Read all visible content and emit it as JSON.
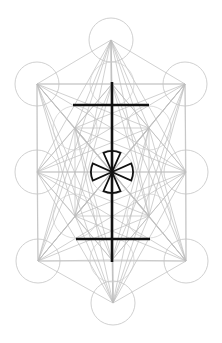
{
  "diagram": {
    "colors": {
      "background": "#ffffff",
      "guide_lines": "#bdbdbd",
      "circles": "#c4c4c4",
      "bold_symbol": "#111111"
    },
    "outer_vertices": [
      {
        "name": "top",
        "x": 111,
        "y": 40
      },
      {
        "name": "upper-left",
        "x": 37,
        "y": 84
      },
      {
        "name": "upper-right",
        "x": 185,
        "y": 84
      },
      {
        "name": "middle-left",
        "x": 37,
        "y": 172
      },
      {
        "name": "middle-right",
        "x": 186,
        "y": 172
      },
      {
        "name": "lower-left",
        "x": 38,
        "y": 261
      },
      {
        "name": "lower-right",
        "x": 186,
        "y": 261
      },
      {
        "name": "bottom",
        "x": 113,
        "y": 303
      }
    ],
    "inner_vertices": [
      {
        "name": "inner-top",
        "x": 112,
        "y": 84
      },
      {
        "name": "inner-upper-left",
        "x": 75,
        "y": 128
      },
      {
        "name": "inner-upper-right",
        "x": 149,
        "y": 128
      },
      {
        "name": "center",
        "x": 112,
        "y": 172
      },
      {
        "name": "inner-lower-left",
        "x": 75,
        "y": 216
      },
      {
        "name": "inner-lower-right",
        "x": 149,
        "y": 216
      },
      {
        "name": "inner-bottom",
        "x": 112,
        "y": 260
      }
    ],
    "circle_radius": 22,
    "symbol": {
      "vertical_bar": {
        "x": 112,
        "y1": 82,
        "y2": 262
      },
      "top_crossbar": {
        "x1": 73,
        "x2": 149,
        "y": 105
      },
      "bottom_crossbar": {
        "x1": 76,
        "x2": 150,
        "y": 239
      },
      "center_emblem": {
        "cx": 112,
        "cy": 172,
        "r": 21,
        "type": "circled cross pattée"
      }
    }
  }
}
